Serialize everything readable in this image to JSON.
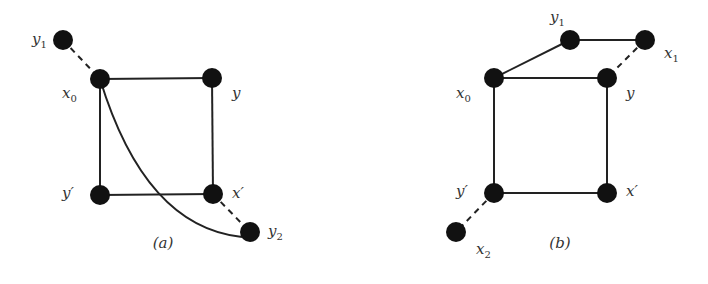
{
  "diagram": {
    "colors": {
      "node": "#111111",
      "edge": "#222222",
      "label": "#333333",
      "background": "#ffffff"
    },
    "node_radius": 10,
    "panels": [
      {
        "id": "a",
        "caption": "(a)",
        "caption_pos": [
          163,
          248
        ],
        "nodes": [
          {
            "id": "y1",
            "label": "y",
            "sub": "1",
            "x": 63,
            "y": 40,
            "lx": 32,
            "ly": 44
          },
          {
            "id": "x0",
            "label": "x",
            "sub": "0",
            "x": 100,
            "y": 79,
            "lx": 62,
            "ly": 98
          },
          {
            "id": "y",
            "label": "y",
            "sub": "",
            "x": 212,
            "y": 78,
            "lx": 232,
            "ly": 98
          },
          {
            "id": "yp",
            "label": "y′",
            "sub": "",
            "x": 100,
            "y": 195,
            "lx": 62,
            "ly": 198
          },
          {
            "id": "xp",
            "label": "x′",
            "sub": "",
            "x": 213,
            "y": 194,
            "lx": 232,
            "ly": 198
          },
          {
            "id": "y2",
            "label": "y",
            "sub": "2",
            "x": 250,
            "y": 232,
            "lx": 268,
            "ly": 236
          }
        ],
        "edges": [
          {
            "from": "x0",
            "to": "y",
            "style": "solid"
          },
          {
            "from": "x0",
            "to": "yp",
            "style": "solid"
          },
          {
            "from": "y",
            "to": "xp",
            "style": "solid"
          },
          {
            "from": "yp",
            "to": "xp",
            "style": "solid"
          },
          {
            "from": "y1",
            "to": "x0",
            "style": "dashed"
          },
          {
            "from": "xp",
            "to": "y2",
            "style": "dashed"
          },
          {
            "from": "x0",
            "to": "y2",
            "style": "curved"
          }
        ]
      },
      {
        "id": "b",
        "caption": "(b)",
        "caption_pos": [
          560,
          248
        ],
        "nodes": [
          {
            "id": "y1",
            "label": "y",
            "sub": "1",
            "x": 570,
            "y": 40,
            "lx": 550,
            "ly": 22
          },
          {
            "id": "x1",
            "label": "x",
            "sub": "1",
            "x": 645,
            "y": 40,
            "lx": 664,
            "ly": 58
          },
          {
            "id": "x0",
            "label": "x",
            "sub": "0",
            "x": 494,
            "y": 78,
            "lx": 456,
            "ly": 98
          },
          {
            "id": "y",
            "label": "y",
            "sub": "",
            "x": 607,
            "y": 78,
            "lx": 626,
            "ly": 98
          },
          {
            "id": "yp",
            "label": "y′",
            "sub": "",
            "x": 494,
            "y": 193,
            "lx": 456,
            "ly": 196
          },
          {
            "id": "xp",
            "label": "x′",
            "sub": "",
            "x": 607,
            "y": 193,
            "lx": 626,
            "ly": 196
          },
          {
            "id": "x2",
            "label": "x",
            "sub": "2",
            "x": 456,
            "y": 232,
            "lx": 476,
            "ly": 254
          }
        ],
        "edges": [
          {
            "from": "x0",
            "to": "y",
            "style": "solid"
          },
          {
            "from": "x0",
            "to": "yp",
            "style": "solid"
          },
          {
            "from": "y",
            "to": "xp",
            "style": "solid"
          },
          {
            "from": "yp",
            "to": "xp",
            "style": "solid"
          },
          {
            "from": "x0",
            "to": "y1",
            "style": "solid"
          },
          {
            "from": "y1",
            "to": "x1",
            "style": "solid"
          },
          {
            "from": "x1",
            "to": "y",
            "style": "dashed"
          },
          {
            "from": "yp",
            "to": "x2",
            "style": "dashed"
          }
        ]
      }
    ]
  }
}
